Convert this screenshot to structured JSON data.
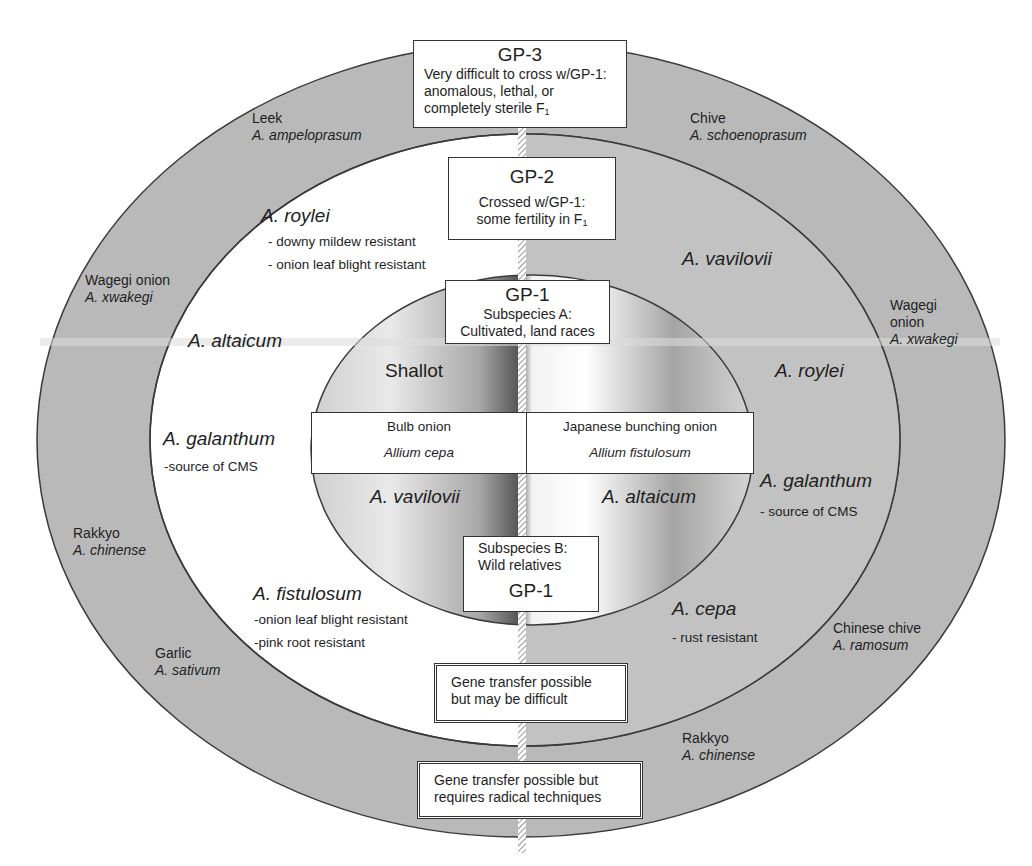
{
  "diagram": {
    "gp3_box": {
      "heading": "GP-3",
      "lines": [
        "Very  difficult to cross w/GP-1:",
        "anomalous, lethal, or",
        "completely sterile F"
      ],
      "subscript": "1"
    },
    "gp2_box": {
      "heading": "GP-2",
      "lines": [
        "Crossed w/GP-1:",
        "some fertility in F"
      ],
      "subscript": "1"
    },
    "gp1a_box": {
      "heading": "GP-1",
      "lines": [
        "Subspecies A:",
        "Cultivated, land races"
      ]
    },
    "gp1b_box": {
      "heading": "GP-1",
      "lines": [
        "Subspecies B:",
        "Wild relatives"
      ]
    },
    "center_band": {
      "left": {
        "common": "Bulb onion",
        "scientific": "Allium cepa"
      },
      "right": {
        "common": "Japanese bunching onion",
        "scientific": "Allium fistulosum"
      }
    },
    "inner_labels": {
      "shallot": "Shallot",
      "left_lower": "A. vavilovii",
      "right_lower": "A. altaicum"
    },
    "gp2_left": [
      {
        "name": "A. roylei",
        "traits": [
          "- downy mildew resistant",
          "- onion leaf blight resistant"
        ]
      },
      {
        "name": "A. altaicum",
        "traits": []
      },
      {
        "name": "A. galanthum",
        "traits": [
          "-source of CMS"
        ]
      },
      {
        "name": "A. fistulosum",
        "traits": [
          "-onion leaf blight resistant",
          "-pink root resistant"
        ]
      }
    ],
    "gp2_right": [
      {
        "name": "A. vavilovii",
        "traits": []
      },
      {
        "name": "A. roylei",
        "traits": []
      },
      {
        "name": "A. galanthum",
        "traits": [
          "- source of CMS"
        ]
      },
      {
        "name": "A. cepa",
        "traits": [
          "- rust resistant"
        ]
      }
    ],
    "gp3_left": [
      {
        "common": "Leek",
        "scientific": "A. ampeloprasum"
      },
      {
        "common": "Wagegi onion",
        "scientific": "A. xwakegi"
      },
      {
        "common": "Rakkyo",
        "scientific": "A. chinense"
      },
      {
        "common": "Garlic",
        "scientific": "A. sativum"
      }
    ],
    "gp3_right": [
      {
        "common": "Chive",
        "scientific": "A. schoenoprasum"
      },
      {
        "common": "Wagegi",
        "common2": "onion",
        "scientific": "A. xwakegi"
      },
      {
        "common": "Chinese chive",
        "scientific": "A. ramosum"
      },
      {
        "common": "Rakkyo",
        "scientific": "A. chinense"
      }
    ],
    "legend_boxes": {
      "gp2_transfer": [
        "Gene transfer possible",
        "but may be difficult"
      ],
      "gp3_transfer": [
        "Gene transfer possible but",
        "requires radical techniques"
      ]
    },
    "colors": {
      "outer_ring": "#b9b9b9",
      "middle_ring_right": "#c2c2c2",
      "middle_ring_left": "#ffffff",
      "outline": "#3a3a3a"
    }
  }
}
